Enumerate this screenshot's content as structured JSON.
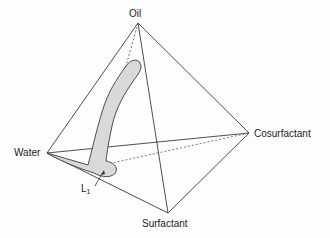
{
  "diagram": {
    "type": "phase tetrahedron",
    "vertices": {
      "oil": "Oil",
      "water": "Water",
      "cosurfactant": "Cosurfactant",
      "surfactant": "Surfactant"
    },
    "region": {
      "label": "L",
      "subscript": "1"
    },
    "colors": {
      "edge": "#3a3a3a",
      "region_fill": "#d9d9d9",
      "text": "#222222"
    }
  }
}
